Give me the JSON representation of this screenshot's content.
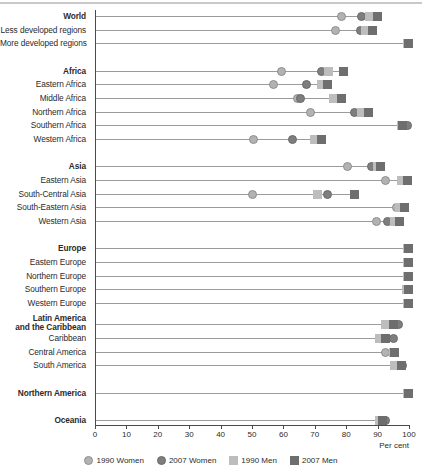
{
  "chart_data": {
    "type": "scatter",
    "title": "",
    "xlabel": "Per cent",
    "ylabel": "",
    "xlim": [
      0,
      100
    ],
    "grid": false,
    "legend_position": "bottom",
    "tick_labels": [
      "0",
      "10",
      "20",
      "30",
      "40",
      "50",
      "60",
      "70",
      "80",
      "90",
      "100"
    ],
    "tick_values": [
      0,
      10,
      20,
      30,
      40,
      50,
      60,
      70,
      80,
      90,
      100
    ],
    "series": [
      {
        "name": "1990 Women",
        "marker": "circle",
        "color": "#b2b2b2",
        "key": "women_1990"
      },
      {
        "name": "2007 Women",
        "marker": "circle",
        "color": "#7e7e7e",
        "key": "women_2007"
      },
      {
        "name": "1990 Men",
        "marker": "square",
        "color": "#bdbdbd",
        "key": "men_1990"
      },
      {
        "name": "2007 Men",
        "marker": "square",
        "color": "#6e6e6e",
        "key": "men_2007"
      }
    ],
    "categories": [
      "World",
      "Less developed regions",
      "More developed regions",
      "Africa",
      "Eastern Africa",
      "Middle Africa",
      "Northern Africa",
      "Southern Africa",
      "Western Africa",
      "Asia",
      "Eastern Asia",
      "South-Central Asia",
      "South-Eastern Asia",
      "Western Asia",
      "Europe",
      "Eastern Europe",
      "Northern Europe",
      "Southern Europe",
      "Western Europe",
      "Latin America and the Caribbean",
      "Caribbean",
      "Central America",
      "South America",
      "Northern America",
      "Oceania"
    ],
    "rows": [
      {
        "label": "World",
        "bold": true,
        "gap_before": 0,
        "women_1990": 78.5,
        "women_2007": 85.0,
        "men_1990": 87.5,
        "men_2007": 90.0
      },
      {
        "label": "Less developed regions",
        "bold": false,
        "gap_before": 0,
        "women_1990": 76.5,
        "women_2007": 84.5,
        "men_1990": 86.0,
        "men_2007": 88.5
      },
      {
        "label": "More developed regions",
        "bold": false,
        "gap_before": 0,
        "women_1990": 99.5,
        "women_2007": 99.7,
        "men_1990": 99.5,
        "men_2007": 99.8
      },
      {
        "label": "Africa",
        "bold": true,
        "gap_before": 14,
        "women_1990": 59.5,
        "women_2007": 72.0,
        "men_1990": 74.5,
        "men_2007": 79.0
      },
      {
        "label": "Eastern Africa",
        "bold": false,
        "gap_before": 0,
        "women_1990": 57.0,
        "women_2007": 67.5,
        "men_1990": 72.0,
        "men_2007": 74.0
      },
      {
        "label": "Middle Africa",
        "bold": false,
        "gap_before": 0,
        "women_1990": 64.5,
        "women_2007": 65.5,
        "men_1990": 76.0,
        "men_2007": 78.5
      },
      {
        "label": "Northern Africa",
        "bold": false,
        "gap_before": 0,
        "women_1990": 68.5,
        "women_2007": 82.5,
        "men_1990": 85.0,
        "men_2007": 87.0
      },
      {
        "label": "Southern Africa",
        "bold": false,
        "gap_before": 0,
        "women_1990": 98.5,
        "women_2007": 99.5,
        "men_1990": 97.5,
        "men_2007": 98.0
      },
      {
        "label": "Western Africa",
        "bold": false,
        "gap_before": 0,
        "women_1990": 50.5,
        "women_2007": 63.0,
        "men_1990": 70.0,
        "men_2007": 72.0
      },
      {
        "label": "Asia",
        "bold": true,
        "gap_before": 14,
        "women_1990": 80.5,
        "women_2007": 88.0,
        "men_1990": 90.0,
        "men_2007": 91.0
      },
      {
        "label": "Eastern Asia",
        "bold": false,
        "gap_before": 0,
        "women_1990": 92.5,
        "women_2007": 99.0,
        "men_1990": 97.5,
        "men_2007": 99.5
      },
      {
        "label": "South-Central Asia",
        "bold": false,
        "gap_before": 0,
        "women_1990": 50.0,
        "women_2007": 74.0,
        "men_1990": 71.0,
        "men_2007": 82.5
      },
      {
        "label": "South-Eastern Asia",
        "bold": false,
        "gap_before": 0,
        "women_1990": 96.0,
        "women_2007": 98.5,
        "men_1990": 97.0,
        "men_2007": 98.5
      },
      {
        "label": "Western Asia",
        "bold": false,
        "gap_before": 0,
        "women_1990": 89.5,
        "women_2007": 93.0,
        "men_1990": 95.5,
        "men_2007": 97.0
      },
      {
        "label": "Europe",
        "bold": true,
        "gap_before": 14,
        "women_1990": 99.5,
        "women_2007": 99.8,
        "men_1990": 99.5,
        "men_2007": 99.8
      },
      {
        "label": "Eastern Europe",
        "bold": false,
        "gap_before": 0,
        "women_1990": 99.5,
        "women_2007": 99.8,
        "men_1990": 99.5,
        "men_2007": 99.8
      },
      {
        "label": "Northern Europe",
        "bold": false,
        "gap_before": 0,
        "women_1990": 99.5,
        "women_2007": 99.8,
        "men_1990": 99.5,
        "men_2007": 99.8
      },
      {
        "label": "Southern Europe",
        "bold": false,
        "gap_before": 0,
        "women_1990": 99.3,
        "women_2007": 99.7,
        "men_1990": 99.3,
        "men_2007": 99.7
      },
      {
        "label": "Western Europe",
        "bold": false,
        "gap_before": 0,
        "women_1990": 99.5,
        "women_2007": 99.8,
        "men_1990": 99.5,
        "men_2007": 99.8
      },
      {
        "label": "Latin America and the Caribbean",
        "label_line1": "Latin America",
        "label_line2": "and the Caribbean",
        "bold": true,
        "two_line": true,
        "gap_before": 8,
        "women_1990": 94.5,
        "women_2007": 96.5,
        "men_1990": 92.5,
        "men_2007": 95.0
      },
      {
        "label": "Caribbean",
        "bold": false,
        "gap_before": 0,
        "women_1990": 92.0,
        "women_2007": 95.0,
        "men_1990": 90.5,
        "men_2007": 92.5
      },
      {
        "label": "Central America",
        "bold": false,
        "gap_before": 0,
        "women_1990": 92.5,
        "women_2007": 95.5,
        "men_1990": 95.0,
        "men_2007": 95.5
      },
      {
        "label": "South America",
        "bold": false,
        "gap_before": 0,
        "women_1990": 96.0,
        "women_2007": 98.0,
        "men_1990": 95.5,
        "men_2007": 97.5
      },
      {
        "label": "Northern America",
        "bold": true,
        "gap_before": 14,
        "women_1990": 99.5,
        "women_2007": 99.8,
        "men_1990": 99.5,
        "men_2007": 99.8
      },
      {
        "label": "Oceania",
        "bold": true,
        "gap_before": 14,
        "women_1990": 91.5,
        "women_2007": 92.5,
        "men_1990": 90.5,
        "men_2007": 91.5
      }
    ]
  },
  "axis": {
    "x_title": "Per cent"
  },
  "legend": {
    "items": [
      {
        "label": "1990 Women",
        "shape": "circle",
        "color": "#b2b2b2",
        "border": "#8f8f8f"
      },
      {
        "label": "2007 Women",
        "shape": "circle",
        "color": "#7e7e7e",
        "border": "#6a6a6a"
      },
      {
        "label": "1990 Men",
        "shape": "square",
        "color": "#bdbdbd",
        "border": "#bdbdbd"
      },
      {
        "label": "2007 Men",
        "shape": "square",
        "color": "#6e6e6e",
        "border": "#6e6e6e"
      }
    ]
  },
  "colors": {
    "women_1990": "#b2b2b2",
    "women_2007": "#7e7e7e",
    "men_1990": "#bdbdbd",
    "men_2007": "#6e6e6e",
    "axis": "#4a4a4a",
    "track": "#9b9b9b",
    "text": "#2b2b2b"
  }
}
